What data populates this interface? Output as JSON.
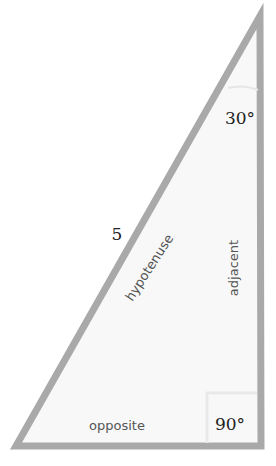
{
  "diagram": {
    "type": "right-triangle",
    "colors": {
      "stroke": "#a9a9a9",
      "fill": "#f8f8f8",
      "text": "#555555",
      "serif_text": "#222222"
    },
    "vertices": {
      "apex": [
        260,
        16
      ],
      "bottom_left": [
        16,
        446
      ],
      "bottom_right": [
        261,
        446
      ]
    },
    "labels": {
      "hypotenuse_length": "5",
      "hypotenuse": "hypotenuse",
      "adjacent": "adjacent",
      "opposite": "opposite",
      "angle_top": "30°",
      "angle_right": "90°"
    }
  }
}
